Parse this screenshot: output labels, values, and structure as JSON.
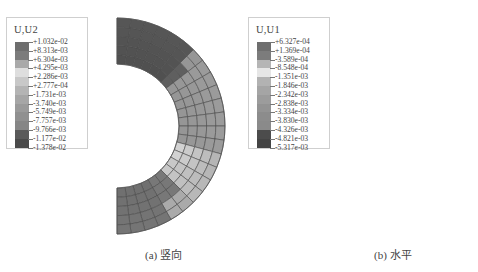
{
  "panels": [
    {
      "id": "a",
      "caption": "(a) 竖向",
      "legend": {
        "title": "U,U2",
        "values": [
          "+1.032e-02",
          "+8.313e-03",
          "+6.304e-03",
          "+4.295e-03",
          "+2.286e-03",
          "+2.777e-04",
          "-1.731e-03",
          "-3.740e-03",
          "-5.749e-03",
          "-7.757e-03",
          "-9.766e-03",
          "-1.177e-02",
          "-1.378e-02"
        ],
        "colors": [
          "#6e6e6e",
          "#7c7c7c",
          "#a9a9a9",
          "#dedede",
          "#c8c8c8",
          "#b4b4b4",
          "#a6a6a6",
          "#9a9a9a",
          "#909090",
          "#868686",
          "#5a5a5a",
          "#4a4a4a"
        ]
      }
    },
    {
      "id": "b",
      "caption": "(b) 水平",
      "legend": {
        "title": "U,U1",
        "values": [
          "+6.327e-04",
          "+1.369e-04",
          "-3.589e-04",
          "-8.548e-04",
          "-1.351e-03",
          "-1.846e-03",
          "-2.342e-03",
          "-2.838e-03",
          "-3.334e-03",
          "-3.830e-03",
          "-4.326e-03",
          "-4.821e-03",
          "-5.317e-03"
        ],
        "colors": [
          "#6e6e6e",
          "#7c7c7c",
          "#b5b5b5",
          "#e6e6e6",
          "#b2b2b2",
          "#a5a5a5",
          "#9c9c9c",
          "#939393",
          "#8c8c8c",
          "#8a8a8a",
          "#4c4c4c",
          "#444444"
        ]
      }
    }
  ]
}
